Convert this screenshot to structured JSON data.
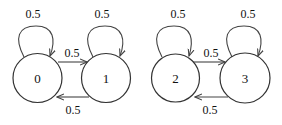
{
  "diagram": {
    "type": "markov-chain",
    "nodes": [
      {
        "id": "0",
        "label": "0"
      },
      {
        "id": "1",
        "label": "1"
      },
      {
        "id": "2",
        "label": "2"
      },
      {
        "id": "3",
        "label": "3"
      }
    ],
    "edges": [
      {
        "from": "0",
        "to": "0",
        "label": "0.5"
      },
      {
        "from": "0",
        "to": "1",
        "label": "0.5"
      },
      {
        "from": "1",
        "to": "1",
        "label": "0.5"
      },
      {
        "from": "1",
        "to": "0",
        "label": "0.5"
      },
      {
        "from": "2",
        "to": "2",
        "label": "0.5"
      },
      {
        "from": "2",
        "to": "3",
        "label": "0.5"
      },
      {
        "from": "3",
        "to": "3",
        "label": "0.5"
      },
      {
        "from": "3",
        "to": "2",
        "label": "0.5"
      }
    ]
  }
}
